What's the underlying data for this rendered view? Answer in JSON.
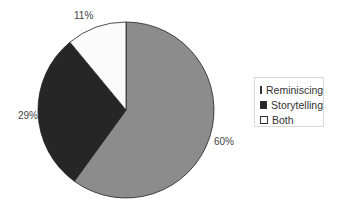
{
  "chart_data": {
    "type": "pie",
    "title": "",
    "categories": [
      "Reminiscing",
      "Storytelling",
      "Both"
    ],
    "values": [
      60,
      29,
      11
    ],
    "labels": [
      "60%",
      "29%",
      "11%"
    ],
    "colors": [
      "#8c8c8c",
      "#262626",
      "#fbfbfb"
    ],
    "legend_position": "right",
    "start_angle_deg": 0,
    "direction": "clockwise"
  },
  "legend": {
    "items": [
      {
        "label": "Reminiscing",
        "color": "#8c8c8c"
      },
      {
        "label": "Storytelling",
        "color": "#262626"
      },
      {
        "label": "Both",
        "color": "#fbfbfb"
      }
    ]
  }
}
